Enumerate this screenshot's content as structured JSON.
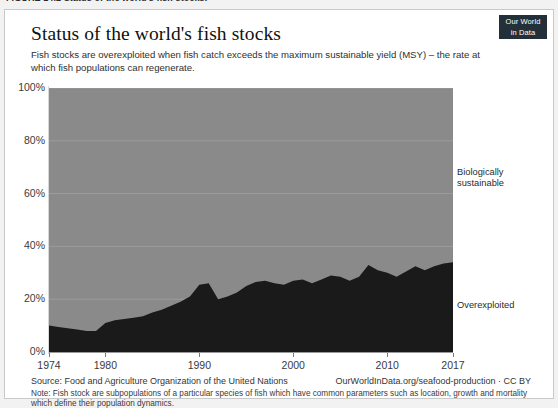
{
  "page_caption": "FIGURE 14.2 Status of the world's fish stocks.",
  "logo": {
    "line1": "Our World",
    "line2": "in Data"
  },
  "chart": {
    "title": "Status of the world's fish stocks",
    "subtitle": "Fish stocks are overexploited when fish catch exceeds the maximum sustainable yield (MSY) – the rate at which fish populations can regenerate.",
    "series_label_sustainable": "Biologically\nsustainable",
    "series_label_overexploited": "Overexploited"
  },
  "footer": {
    "source": "Source: Food and Agriculture Organization of the United Nations",
    "url": "OurWorldInData.org/seafood-production · CC BY",
    "note": "Note: Fish stock are subpopulations of a particular species of fish which have common parameters such as location, growth and mortality which define their population dynamics."
  },
  "colors": {
    "overexploited": "#1a1a1a",
    "sustainable": "#8a8a8a",
    "logo_bg": "#23303a",
    "page_bg": "#f2f2f2",
    "card_bg": "#ffffff"
  },
  "chart_data": {
    "type": "area",
    "title": "Status of the world's fish stocks",
    "subtitle": "Fish stocks are overexploited when fish catch exceeds the maximum sustainable yield (MSY) – the rate at which fish populations can regenerate.",
    "xlabel": "",
    "ylabel": "",
    "stacked": true,
    "normalized_percent": true,
    "grid": true,
    "legend_position": "right-inline",
    "xlim": [
      1974,
      2017
    ],
    "ylim": [
      0,
      100
    ],
    "yticks": [
      0,
      20,
      40,
      60,
      80,
      100
    ],
    "ytick_labels": [
      "0%",
      "20%",
      "40%",
      "60%",
      "80%",
      "100%"
    ],
    "xticks": [
      1974,
      1980,
      1990,
      2000,
      2010,
      2017
    ],
    "xtick_labels": [
      "1974",
      "1980",
      "1990",
      "2000",
      "2010",
      "2017"
    ],
    "x": [
      1974,
      1975,
      1976,
      1977,
      1978,
      1979,
      1980,
      1981,
      1982,
      1983,
      1984,
      1985,
      1986,
      1987,
      1988,
      1989,
      1990,
      1991,
      1992,
      1993,
      1994,
      1995,
      1996,
      1997,
      1998,
      1999,
      2000,
      2001,
      2002,
      2003,
      2004,
      2005,
      2006,
      2007,
      2008,
      2009,
      2010,
      2011,
      2012,
      2013,
      2014,
      2015,
      2016,
      2017
    ],
    "series": [
      {
        "name": "Overexploited",
        "color": "#1a1a1a",
        "values": [
          10,
          9.5,
          9,
          8.5,
          8,
          8,
          11,
          12,
          12.5,
          13,
          13.5,
          15,
          16,
          17.5,
          19,
          21,
          25.5,
          26,
          20,
          21,
          22.5,
          25,
          26.5,
          27,
          26,
          25.5,
          27,
          27.5,
          26,
          27.5,
          29,
          28.5,
          27,
          28.5,
          33,
          31,
          30,
          28.5,
          30.5,
          32.5,
          31,
          32.5,
          33.5,
          34
        ]
      },
      {
        "name": "Biologically sustainable",
        "color": "#8a8a8a",
        "values": [
          90,
          90.5,
          91,
          91.5,
          92,
          92,
          89,
          88,
          87.5,
          87,
          86.5,
          85,
          84,
          82.5,
          81,
          79,
          74.5,
          74,
          80,
          79,
          77.5,
          75,
          73.5,
          73,
          74,
          74.5,
          73,
          72.5,
          74,
          72.5,
          71,
          71.5,
          73,
          71.5,
          67,
          69,
          70,
          71.5,
          69.5,
          67.5,
          69,
          67.5,
          66.5,
          66
        ]
      }
    ]
  }
}
